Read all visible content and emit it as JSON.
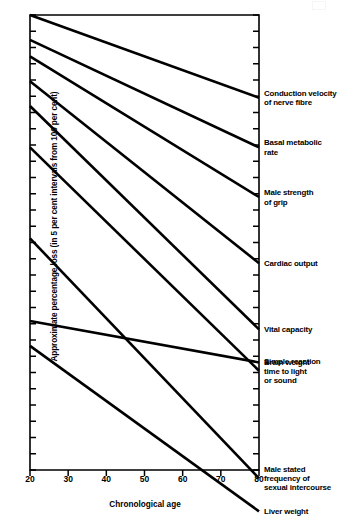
{
  "chart_data": {
    "type": "line",
    "title": "",
    "xlabel": "Chronological age",
    "ylabel": "Approximate percentage loss (in 5 per cent intervals from 100 per cent)",
    "xlim": [
      20,
      80
    ],
    "xticks": [
      20,
      30,
      40,
      50,
      60,
      70,
      80
    ],
    "xticklabels": [
      "20",
      "30",
      "40",
      "50",
      "60",
      "70",
      "80"
    ],
    "ylim": [
      45,
      100
    ],
    "ytick_interval": 5,
    "ytick_count": 28,
    "yticklabels": [],
    "grid": false,
    "legend": "right-of-plot-inline",
    "x": [
      20,
      80
    ],
    "series": [
      {
        "name": "Conduction velocity of nerve fibre",
        "label": "Conduction velocity\nof nerve fibre",
        "values": [
          100,
          90
        ]
      },
      {
        "name": "Basal metabolic rate",
        "label": "Basal metabolic\nrate",
        "values": [
          97,
          84
        ]
      },
      {
        "name": "Male strength of grip",
        "label": "Male strength\nof grip",
        "values": [
          95,
          78
        ]
      },
      {
        "name": "Cardiac output",
        "label": "Cardiac output",
        "values": [
          92,
          70
        ]
      },
      {
        "name": "Vital capacity",
        "label": "Vital capacity",
        "values": [
          89,
          62
        ]
      },
      {
        "name": "Simple reaction time to light or sound",
        "label": "Simple reaction\ntime to light\nor sound",
        "values": [
          84,
          57
        ]
      },
      {
        "name": "Male stated frequency of sexual intercourse",
        "label": "Male stated\nfrequency of\nsexual intercourse",
        "values": [
          73,
          44
        ]
      },
      {
        "name": "Brain weight",
        "label": "Brain weight",
        "values": [
          63,
          58
        ]
      },
      {
        "name": "Liver weight",
        "label": "Liver weight",
        "values": [
          60,
          40
        ]
      }
    ]
  },
  "axes": {
    "x_axis_title": "Chronological age",
    "y_axis_title": "Approximate percentage loss (in 5 per cent intervals from 100 per cent)"
  },
  "colors": {
    "line": "#000000",
    "axis": "#000000",
    "background": "#ffffff"
  }
}
